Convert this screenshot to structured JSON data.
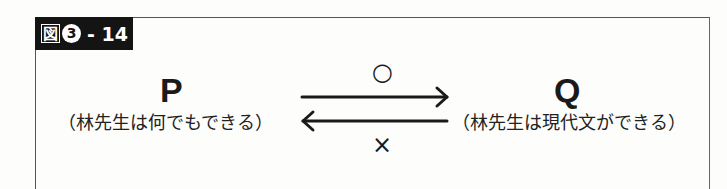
{
  "figure": {
    "label_kanji": "図",
    "label_number": "3",
    "label_suffix": "- 14"
  },
  "left_node": {
    "letter": "P",
    "description": "（林先生は何でもできる）"
  },
  "right_node": {
    "letter": "Q",
    "description": "（林先生は現代文ができる）"
  },
  "arrows": {
    "forward_symbol": "○",
    "backward_symbol": "×"
  }
}
